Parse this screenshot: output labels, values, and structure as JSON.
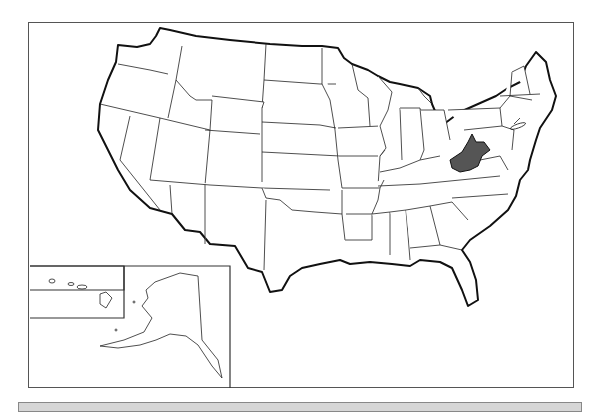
{
  "map": {
    "title": "United States outline map",
    "highlighted_state": "West Virginia",
    "highlight_color": "#555555",
    "background_color": "#ffffff",
    "border_color": "#222222",
    "insets": [
      "Hawaii",
      "Alaska"
    ]
  },
  "footer": {
    "bar_color": "#d6d6d6"
  }
}
